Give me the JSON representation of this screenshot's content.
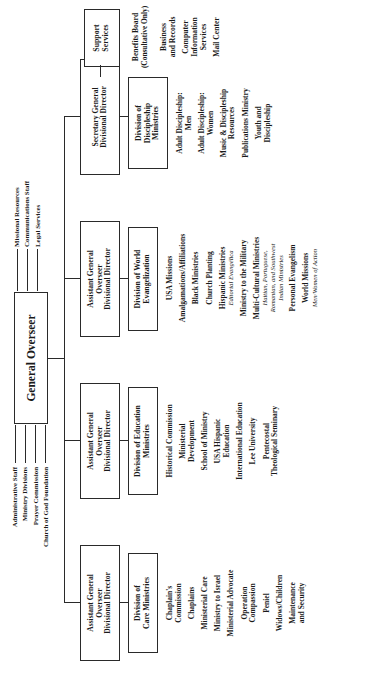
{
  "chart": {
    "root": {
      "name": "general-overseer",
      "label_lines": [
        "General Overseer"
      ]
    },
    "staff_left": [
      "Administrative Staff",
      "Ministry Divisions",
      "Prayer Commission",
      "Church of God Foundation"
    ],
    "staff_right": [
      "Missional Resources",
      "Communications Staff",
      "Legal Services"
    ],
    "officers": [
      {
        "name": "officer-care",
        "lines": [
          "Assistant General",
          "Overseer",
          "Divisional Director"
        ]
      },
      {
        "name": "officer-education",
        "lines": [
          "Assistant General",
          "Overseer",
          "Divisional Director"
        ]
      },
      {
        "name": "officer-world-evangelization",
        "lines": [
          "Assistant General",
          "Overseer",
          "Divisional Director"
        ]
      },
      {
        "name": "officer-discipleship",
        "lines": [
          "Secretary General",
          "Divisional Director"
        ]
      }
    ],
    "divisions": [
      {
        "name": "division-care-ministries",
        "title_lines": [
          "Division of",
          "Care Ministries"
        ],
        "items": [
          {
            "lines": [
              "Chaplain's",
              "Commission"
            ]
          },
          {
            "lines": [
              "Chaplains"
            ]
          },
          {
            "lines": [
              "Ministerial Care"
            ]
          },
          {
            "lines": [
              "Ministry to Israel"
            ]
          },
          {
            "lines": [
              "Ministerial Advocate"
            ]
          },
          {
            "lines": [
              "Operation",
              "Compassion"
            ]
          },
          {
            "lines": [
              "Peniel"
            ]
          },
          {
            "lines": [
              "Widows/Children"
            ]
          },
          {
            "lines": [
              "Maintenance",
              "and Security"
            ]
          }
        ]
      },
      {
        "name": "division-education-ministries",
        "title_lines": [
          "Division of Education",
          "Ministries"
        ],
        "items": [
          {
            "lines": [
              "Historical Commission"
            ]
          },
          {
            "lines": [
              "Ministerial",
              "Development"
            ]
          },
          {
            "lines": [
              "School of Ministry"
            ]
          },
          {
            "lines": [
              "USA Hispanic",
              "Education"
            ]
          },
          {
            "lines": [
              "International Education"
            ]
          },
          {
            "lines": [
              "Lee University"
            ]
          },
          {
            "lines": [
              "Pentecostal",
              "Theological Seminary"
            ]
          }
        ]
      },
      {
        "name": "division-world-evangelization",
        "title_lines": [
          "Division of World",
          "Evangelization"
        ],
        "items": [
          {
            "lines": [
              "USA Missions"
            ]
          },
          {
            "lines": [
              "Amalgamations/Affiliations"
            ]
          },
          {
            "lines": [
              "Black Ministries"
            ]
          },
          {
            "lines": [
              "Church Planting"
            ]
          },
          {
            "lines": [
              "Hispanic Ministries"
            ],
            "sub": [
              "Editorial Evangélica"
            ]
          },
          {
            "lines": [
              "Ministry to the Military"
            ]
          },
          {
            "lines": [
              "Multi-Cultural Ministries"
            ],
            "sub": [
              "Haitian, Portuguese,",
              "Romanian, and Southwest",
              "Indian Ministries"
            ]
          },
          {
            "lines": [
              "Personal Evangelism"
            ]
          },
          {
            "lines": [
              "World Missions"
            ],
            "sub": [
              "Men/Women of Action"
            ]
          }
        ]
      },
      {
        "name": "division-discipleship-ministries",
        "title_lines": [
          "Division of",
          "Discipleship",
          "Ministries"
        ],
        "items": [
          {
            "lines": [
              "Adult Discipleship:",
              "Men"
            ]
          },
          {
            "lines": [
              "Adult Discipleship:",
              "Women"
            ]
          },
          {
            "lines": [
              "Music & Discipleship",
              "Resources"
            ]
          },
          {
            "lines": [
              "Publications Ministry"
            ]
          },
          {
            "lines": [
              "Youth and",
              "Discipleship"
            ]
          }
        ]
      }
    ],
    "support": {
      "name": "support-services",
      "title_lines": [
        "Support",
        "Services"
      ],
      "header_lines": [
        "Benefits Board",
        "(Consultative Only)"
      ],
      "items": [
        {
          "lines": [
            "Business",
            "and Records"
          ]
        },
        {
          "lines": [
            "Computer",
            "Information",
            "Services"
          ]
        },
        {
          "lines": [
            "Mail Center"
          ]
        }
      ]
    }
  }
}
